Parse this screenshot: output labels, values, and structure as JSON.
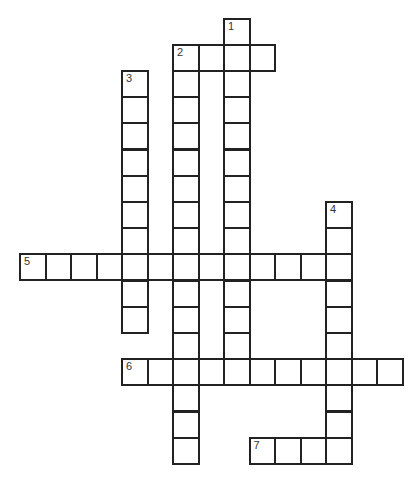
{
  "puzzle": {
    "type": "crossword",
    "grid": {
      "origin_x": 20,
      "origin_y": 18.5,
      "cell_w": 25.5,
      "cell_h": 26.2,
      "line_color": "#222222"
    },
    "entries": [
      {
        "number": "1",
        "direction": "down",
        "row": 0,
        "col": 8,
        "length": 14
      },
      {
        "number": "2",
        "direction": "across",
        "row": 1,
        "col": 6,
        "length": 4
      },
      {
        "number": "2",
        "direction": "down",
        "row": 1,
        "col": 6,
        "length": 16
      },
      {
        "number": "3",
        "direction": "down",
        "row": 2,
        "col": 4,
        "length": 10
      },
      {
        "number": "4",
        "direction": "down",
        "row": 7,
        "col": 12,
        "length": 10
      },
      {
        "number": "5",
        "direction": "across",
        "row": 9,
        "col": 0,
        "length": 13
      },
      {
        "number": "6",
        "direction": "across",
        "row": 13,
        "col": 4,
        "length": 11
      },
      {
        "number": "7",
        "direction": "across",
        "row": 16,
        "col": 9,
        "length": 4
      }
    ]
  }
}
